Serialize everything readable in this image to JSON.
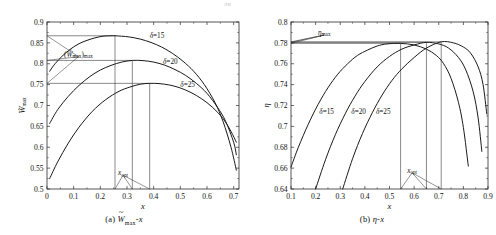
{
  "page_artifact": "ли",
  "figure": {
    "panels": [
      {
        "id": "panel-a",
        "caption_prefix": "(a)",
        "caption_body": "Wmax-x",
        "caption_main": "W",
        "caption_sub": "max",
        "caption_tail": "-x",
        "xlabel": "x",
        "ylabel": "Wmax",
        "ylabel_main": "W",
        "ylabel_sub": "max",
        "annotations": {
          "peak_label": "(Wmax)max",
          "xopt_label": "xopt",
          "xopt_main": "x",
          "xopt_sub": "opt",
          "series_labels": [
            "δ=15",
            "δ=20",
            "δ=25"
          ]
        },
        "xticks": [
          "0",
          "0.1",
          "0.2",
          "0.3",
          "0.4",
          "0.5",
          "0.6",
          "0.7"
        ],
        "yticks": [
          "0.5",
          "0.55",
          "0.6",
          "0.65",
          "0.7",
          "0.75",
          "0.8",
          "0.85",
          "0.9"
        ]
      },
      {
        "id": "panel-b",
        "caption_prefix": "(b)",
        "caption_body": "η-x",
        "xlabel": "x",
        "ylabel": "η",
        "annotations": {
          "peak_label": "ηmax",
          "peak_main": "η",
          "peak_sub": "max",
          "xopt_label": "xopt",
          "xopt_main": "x",
          "xopt_sub": "opt",
          "series_labels": [
            "δ=15",
            "δ=20",
            "δ=25"
          ]
        },
        "xticks": [
          "0.1",
          "0.2",
          "0.3",
          "0.4",
          "0.5",
          "0.6",
          "0.7",
          "0.8",
          "0.9"
        ],
        "yticks": [
          "0.64",
          "0.66",
          "0.68",
          "0.7",
          "0.72",
          "0.74",
          "0.76",
          "0.78",
          "0.8"
        ]
      }
    ]
  },
  "chart_data": [
    {
      "type": "line",
      "panel": "a",
      "title": "(a) W̃max-x",
      "xlabel": "x",
      "ylabel": "W̃max",
      "xlim": [
        0,
        0.72
      ],
      "ylim": [
        0.5,
        0.9
      ],
      "xticks": [
        0,
        0.1,
        0.2,
        0.3,
        0.4,
        0.5,
        0.6,
        0.7
      ],
      "yticks": [
        0.5,
        0.55,
        0.6,
        0.65,
        0.7,
        0.75,
        0.8,
        0.85,
        0.9
      ],
      "grid": false,
      "legend": "inline-labels",
      "series": [
        {
          "name": "δ=15",
          "peak": {
            "x": 0.255,
            "y": 0.867
          },
          "x": [
            0.01,
            0.03,
            0.06,
            0.09,
            0.12,
            0.15,
            0.18,
            0.21,
            0.24,
            0.255,
            0.28,
            0.31,
            0.35,
            0.39,
            0.43,
            0.47,
            0.51,
            0.55,
            0.59,
            0.63,
            0.66,
            0.69,
            0.71
          ],
          "y": [
            0.782,
            0.8,
            0.82,
            0.836,
            0.848,
            0.856,
            0.862,
            0.866,
            0.867,
            0.867,
            0.866,
            0.864,
            0.859,
            0.851,
            0.84,
            0.825,
            0.806,
            0.782,
            0.75,
            0.707,
            0.662,
            0.6,
            0.545
          ]
        },
        {
          "name": "δ=20",
          "peak": {
            "x": 0.32,
            "y": 0.808
          },
          "x": [
            0.01,
            0.04,
            0.08,
            0.12,
            0.16,
            0.2,
            0.24,
            0.28,
            0.32,
            0.36,
            0.4,
            0.44,
            0.48,
            0.52,
            0.56,
            0.6,
            0.64,
            0.67,
            0.7,
            0.71
          ],
          "y": [
            0.657,
            0.69,
            0.722,
            0.748,
            0.769,
            0.785,
            0.796,
            0.804,
            0.808,
            0.8075,
            0.804,
            0.797,
            0.786,
            0.772,
            0.753,
            0.729,
            0.695,
            0.662,
            0.612,
            0.582
          ]
        },
        {
          "name": "δ=25",
          "peak": {
            "x": 0.385,
            "y": 0.753
          },
          "x": [
            0.01,
            0.04,
            0.08,
            0.12,
            0.17,
            0.22,
            0.27,
            0.31,
            0.35,
            0.385,
            0.42,
            0.46,
            0.5,
            0.54,
            0.58,
            0.62,
            0.66,
            0.69,
            0.71
          ],
          "y": [
            0.525,
            0.565,
            0.61,
            0.648,
            0.686,
            0.714,
            0.734,
            0.744,
            0.751,
            0.753,
            0.7525,
            0.749,
            0.742,
            0.731,
            0.716,
            0.696,
            0.669,
            0.638,
            0.612
          ]
        }
      ],
      "annotations": [
        {
          "text": "(W̃max)max",
          "type": "leader-label",
          "x": 0.118,
          "y": 0.817,
          "points_to": [
            [
              0.0,
              0.867
            ],
            [
              0.0,
              0.808
            ],
            [
              0.0,
              0.753
            ]
          ]
        },
        {
          "text": "xopt",
          "type": "leader-label",
          "x": 0.285,
          "y": 0.533,
          "points_to": [
            [
              0.255,
              0.5
            ],
            [
              0.32,
              0.5
            ],
            [
              0.385,
              0.5
            ]
          ]
        },
        {
          "text": "δ=15",
          "type": "series-label",
          "x": 0.385,
          "y": 0.862
        },
        {
          "text": "δ=20",
          "type": "series-label",
          "x": 0.435,
          "y": 0.8
        },
        {
          "text": "δ=25",
          "type": "series-label",
          "x": 0.5,
          "y": 0.745
        }
      ],
      "guide_lines": {
        "horizontal_at_y": [
          0.867,
          0.808,
          0.753
        ],
        "vertical_at_x": [
          0.255,
          0.32,
          0.385
        ]
      }
    },
    {
      "type": "line",
      "panel": "b",
      "title": "(b) η-x",
      "xlabel": "x",
      "ylabel": "η",
      "xlim": [
        0.1,
        0.9
      ],
      "ylim": [
        0.64,
        0.8
      ],
      "xticks": [
        0.1,
        0.2,
        0.3,
        0.4,
        0.5,
        0.6,
        0.7,
        0.8,
        0.9
      ],
      "yticks": [
        0.64,
        0.66,
        0.68,
        0.7,
        0.72,
        0.74,
        0.76,
        0.78,
        0.8
      ],
      "grid": false,
      "legend": "inline-labels",
      "series": [
        {
          "name": "δ=15",
          "peak": {
            "x": 0.545,
            "y": 0.7795
          },
          "x": [
            0.1,
            0.13,
            0.17,
            0.21,
            0.25,
            0.29,
            0.33,
            0.37,
            0.41,
            0.45,
            0.49,
            0.545,
            0.6,
            0.65,
            0.69,
            0.72,
            0.75,
            0.78,
            0.8,
            0.82
          ],
          "y": [
            0.661,
            0.68,
            0.702,
            0.721,
            0.737,
            0.75,
            0.76,
            0.768,
            0.773,
            0.777,
            0.779,
            0.7795,
            0.778,
            0.774,
            0.768,
            0.76,
            0.746,
            0.723,
            0.699,
            0.662
          ]
        },
        {
          "name": "δ=20",
          "peak": {
            "x": 0.65,
            "y": 0.7805
          },
          "x": [
            0.2,
            0.24,
            0.28,
            0.32,
            0.36,
            0.4,
            0.45,
            0.5,
            0.55,
            0.6,
            0.65,
            0.7,
            0.74,
            0.78,
            0.81,
            0.84,
            0.86,
            0.875
          ],
          "y": [
            0.64,
            0.668,
            0.692,
            0.712,
            0.729,
            0.743,
            0.757,
            0.767,
            0.774,
            0.778,
            0.7805,
            0.779,
            0.775,
            0.766,
            0.754,
            0.733,
            0.708,
            0.676
          ]
        },
        {
          "name": "δ=25",
          "peak": {
            "x": 0.71,
            "y": 0.781
          },
          "x": [
            0.31,
            0.35,
            0.39,
            0.43,
            0.47,
            0.51,
            0.55,
            0.6,
            0.65,
            0.71,
            0.76,
            0.8,
            0.83,
            0.86,
            0.88,
            0.895
          ],
          "y": [
            0.64,
            0.669,
            0.693,
            0.713,
            0.73,
            0.744,
            0.755,
            0.766,
            0.775,
            0.781,
            0.78,
            0.776,
            0.77,
            0.757,
            0.74,
            0.712
          ]
        }
      ],
      "annotations": [
        {
          "text": "ηmax",
          "type": "leader-label",
          "x": 0.235,
          "y": 0.7875,
          "points_to": [
            [
              0.1,
              0.7795
            ],
            [
              0.1,
              0.7805
            ],
            [
              0.1,
              0.781
            ]
          ]
        },
        {
          "text": "xopt",
          "type": "leader-label",
          "x": 0.592,
          "y": 0.6555,
          "points_to": [
            [
              0.545,
              0.64
            ],
            [
              0.65,
              0.64
            ],
            [
              0.71,
              0.64
            ]
          ]
        },
        {
          "text": "δ=15",
          "type": "series-label",
          "x": 0.215,
          "y": 0.7115
        },
        {
          "text": "δ=20",
          "type": "series-label",
          "x": 0.345,
          "y": 0.7115
        },
        {
          "text": "δ=25",
          "type": "series-label",
          "x": 0.445,
          "y": 0.7115
        }
      ],
      "guide_lines": {
        "horizontal_at_y": [
          0.7795,
          0.7805,
          0.781
        ],
        "vertical_at_x": [
          0.545,
          0.65,
          0.71
        ]
      }
    }
  ]
}
